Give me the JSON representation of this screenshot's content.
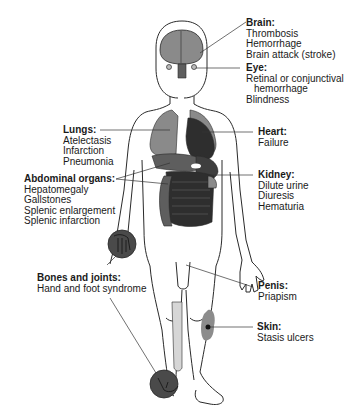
{
  "figure": {
    "colors": {
      "outline": "#2a2a2a",
      "organ_light": "#8a8a8a",
      "organ_mid": "#5e5e5e",
      "organ_dark": "#2e2e2e",
      "bone": "#d6d6d6",
      "skin_lesion": "#8c8c8c",
      "leader_line": "#333333"
    }
  },
  "labels": [
    {
      "id": "brain",
      "title": "Brain:",
      "items": [
        "Thrombosis",
        "Hemorrhage",
        "Brain attack (stroke)"
      ]
    },
    {
      "id": "eye",
      "title": "Eye:",
      "items": [
        "Retinal or conjunctival",
        "hemorrhage",
        "Blindness"
      ]
    },
    {
      "id": "lungs",
      "title": "Lungs:",
      "items": [
        "Atelectasis",
        "Infarction",
        "Pneumonia"
      ]
    },
    {
      "id": "heart",
      "title": "Heart:",
      "items": [
        "Failure"
      ]
    },
    {
      "id": "abdominal",
      "title": "Abdominal organs:",
      "items": [
        "Hepatomegaly",
        "Gallstones",
        "Splenic enlargement",
        "Splenic infarction"
      ]
    },
    {
      "id": "kidney",
      "title": "Kidney:",
      "items": [
        "Dilute urine",
        "Diuresis",
        "Hematuria"
      ]
    },
    {
      "id": "penis",
      "title": "Penis:",
      "items": [
        "Priapism"
      ]
    },
    {
      "id": "bones",
      "title": "Bones and joints:",
      "items": [
        "Hand and foot syndrome"
      ]
    },
    {
      "id": "skin",
      "title": "Skin:",
      "items": [
        "Stasis ulcers"
      ]
    }
  ]
}
